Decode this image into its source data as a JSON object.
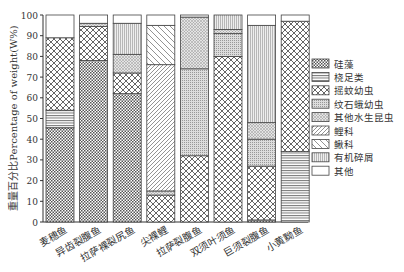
{
  "chart_data": {
    "type": "bar",
    "stacked": true,
    "title": "",
    "xlabel": "",
    "ylabel": "重量百分比Percentage of weight(W%)",
    "ylim": [
      0,
      100
    ],
    "yticks": [
      0,
      10,
      20,
      30,
      40,
      50,
      60,
      70,
      80,
      90,
      100
    ],
    "grid": false,
    "legend_position": "right",
    "categories": [
      "麦穗鱼",
      "异齿裂腹鱼",
      "拉萨裸裂尻鱼",
      "尖裸鲤",
      "拉萨裂腹鱼",
      "双须叶须鱼",
      "巨须裂腹鱼",
      "小黄黝鱼"
    ],
    "series": [
      {
        "name": "硅藻",
        "pattern": "dense-check",
        "values": [
          45.5,
          78,
          62,
          0,
          0,
          0,
          1,
          0
        ]
      },
      {
        "name": "桡足类",
        "pattern": "hlines",
        "values": [
          8.5,
          0,
          0,
          0,
          0,
          0,
          0,
          34
        ]
      },
      {
        "name": "摇蚊幼虫",
        "pattern": "open-check",
        "values": [
          35,
          16.5,
          10,
          13,
          32,
          80,
          26,
          63
        ]
      },
      {
        "name": "纹石蛾幼虫",
        "pattern": "fine-dots",
        "values": [
          0,
          0,
          0,
          0,
          42,
          11,
          13,
          0
        ]
      },
      {
        "name": "其他水生昆虫",
        "pattern": "fine-cross",
        "values": [
          0,
          1.5,
          9,
          2,
          25,
          2,
          8,
          0
        ]
      },
      {
        "name": "鲤科",
        "pattern": "diag-fine",
        "values": [
          0,
          0,
          0,
          61,
          0,
          0,
          0,
          0
        ]
      },
      {
        "name": "鳅科",
        "pattern": "diag-wide",
        "values": [
          0,
          0,
          0,
          19,
          0,
          0,
          0,
          0
        ]
      },
      {
        "name": "有机碎屑",
        "pattern": "vlines",
        "values": [
          0,
          0,
          15,
          0,
          0,
          7,
          47,
          0
        ]
      },
      {
        "name": "其他",
        "pattern": "blank",
        "values": [
          11,
          4,
          4,
          5,
          1,
          0,
          5,
          3
        ]
      }
    ]
  },
  "legend": {
    "items": [
      "硅藻",
      "桡足类",
      "摇蚊幼虫",
      "纹石蛾幼虫",
      "其他水生昆虫",
      "鲤科",
      "鳅科",
      "有机碎屑",
      "其他"
    ]
  }
}
